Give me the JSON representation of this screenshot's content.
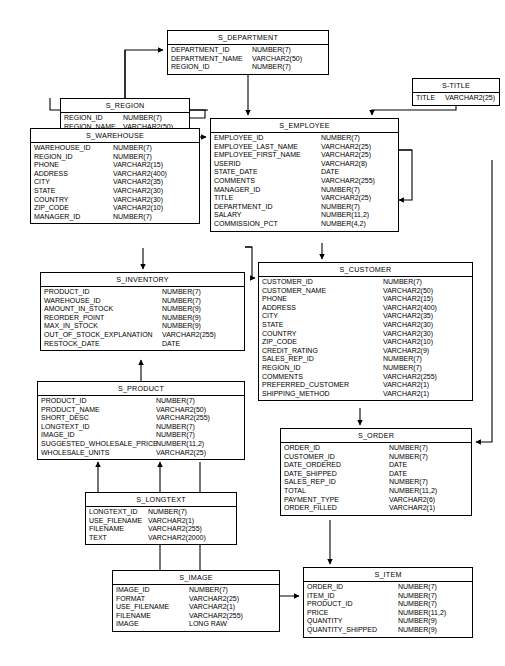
{
  "diagram": {
    "type": "entity-relationship",
    "background": "#ffffff",
    "line_color": "#000000"
  },
  "tables": [
    {
      "id": "s_department",
      "name": "S_DEPARTMENT",
      "x": 167,
      "y": 30,
      "w": 162,
      "type_x": 84,
      "columns": [
        {
          "name": "DEPARTMENT_ID",
          "type": "NUMBER(7)"
        },
        {
          "name": "DEPARTMENT_NAME",
          "type": "VARCHAR2(50)"
        },
        {
          "name": "REGION_ID",
          "type": "NUMBER(7)"
        }
      ]
    },
    {
      "id": "s_title",
      "name": "S-TITLE",
      "x": 412,
      "y": 78,
      "w": 88,
      "type_x": 32,
      "columns": [
        {
          "name": "TITLE",
          "type": "VARCHAR2(25)"
        }
      ]
    },
    {
      "id": "s_region",
      "name": "S_REGION",
      "x": 60,
      "y": 98,
      "w": 130,
      "type_x": 62,
      "columns": [
        {
          "name": "REGION_ID",
          "type": "NUMBER(7)"
        },
        {
          "name": "REGION_NAME",
          "type": "VARCHAR2(50)"
        }
      ]
    },
    {
      "id": "s_employee",
      "name": "S_EMPLOYEE",
      "x": 210,
      "y": 118,
      "w": 189,
      "type_x": 110,
      "columns": [
        {
          "name": "EMPLOYEE_ID",
          "type": "NUMBER(7)"
        },
        {
          "name": "EMPLOYEE_LAST_NAME",
          "type": "VARCHAR2(25)"
        },
        {
          "name": "EMPLOYEE_FIRST_NAME",
          "type": "VARCHAR2(25)"
        },
        {
          "name": "USERID",
          "type": "VARCHAR2(8)"
        },
        {
          "name": "STATE_DATE",
          "type": "DATE"
        },
        {
          "name": "COMMENTS",
          "type": "VARCHAR2(255)"
        },
        {
          "name": "MANAGER_ID",
          "type": "NUMBER(7)"
        },
        {
          "name": "TITLE",
          "type": "VARCHAR2(25)"
        },
        {
          "name": "DEPARTMENT_ID",
          "type": "NUMBER(7)"
        },
        {
          "name": "SALARY",
          "type": "NUMBER(11,2)"
        },
        {
          "name": "COMMISSION_PCT",
          "type": "NUMBER(4,2)"
        }
      ]
    },
    {
      "id": "s_warehouse",
      "name": "S_WAREHOUSE",
      "x": 30,
      "y": 128,
      "w": 170,
      "type_x": 82,
      "columns": [
        {
          "name": "WAREHOUSE_ID",
          "type": "NUMBER(7)"
        },
        {
          "name": "REGION_ID",
          "type": "NUMBER(7)"
        },
        {
          "name": "PHONE",
          "type": "VARCHAR2(15)"
        },
        {
          "name": "ADDRESS",
          "type": "VARCHAR2(400)"
        },
        {
          "name": "CITY",
          "type": "VARCHAR2(35)"
        },
        {
          "name": "STATE",
          "type": "VARCHAR2(30)"
        },
        {
          "name": "COUNTRY",
          "type": "VARCHAR2(30)"
        },
        {
          "name": "ZIP_CODE",
          "type": "VARCHAR2(10)"
        },
        {
          "name": "MANAGER_ID",
          "type": "NUMBER(7)"
        }
      ]
    },
    {
      "id": "s_inventory",
      "name": "S_INVENTORY",
      "x": 40,
      "y": 272,
      "w": 205,
      "type_x": 121,
      "columns": [
        {
          "name": "PRODUCT_ID",
          "type": "NUMBER(7)"
        },
        {
          "name": "WAREHOUSE_ID",
          "type": "NUMBER(7)"
        },
        {
          "name": "AMOUNT_IN_STOCK",
          "type": "NUMBER(9)"
        },
        {
          "name": "REORDER_POINT",
          "type": "NUMBER(9)"
        },
        {
          "name": "MAX_IN_STOCK",
          "type": "NUMBER(9)"
        },
        {
          "name": "OUT_OF_STOCK_EXPLANATION",
          "type": "VARCHAR2(255)"
        },
        {
          "name": "RESTOCK_DATE",
          "type": "DATE"
        }
      ]
    },
    {
      "id": "s_customer",
      "name": "S_CUSTOMER",
      "x": 258,
      "y": 262,
      "w": 215,
      "type_x": 124,
      "columns": [
        {
          "name": "CUSTOMER_ID",
          "type": "NUMBER(7)"
        },
        {
          "name": "CUSTOMER_NAME",
          "type": "VARCHAR2(50)"
        },
        {
          "name": "PHONE",
          "type": "VARCHAR2(15)"
        },
        {
          "name": "ADDRESS",
          "type": "VARCHAR2(400)"
        },
        {
          "name": "CITY",
          "type": "VARCHAR2(35)"
        },
        {
          "name": "STATE",
          "type": "VARCHAR2(30)"
        },
        {
          "name": "COUNTRY",
          "type": "VARCHAR2(30)"
        },
        {
          "name": "ZIP_CODE",
          "type": "VARCHAR2(10)"
        },
        {
          "name": "CREDIT_RATING",
          "type": "VARCHAR2(9)"
        },
        {
          "name": "SALES_REP_ID",
          "type": "NUMBER(7)"
        },
        {
          "name": "REGION_ID",
          "type": "NUMBER(7)"
        },
        {
          "name": "COMMENTS",
          "type": "VARCHAR2(255)"
        },
        {
          "name": "PREFERRED_CUSTOMER",
          "type": "VARCHAR2(1)"
        },
        {
          "name": "SHIPPING_METHOD",
          "type": "VARCHAR2(1)"
        }
      ]
    },
    {
      "id": "s_product",
      "name": "S_PRODUCT",
      "x": 37,
      "y": 381,
      "w": 208,
      "type_x": 118,
      "columns": [
        {
          "name": "PRODUCT_ID",
          "type": "NUMBER(7)"
        },
        {
          "name": "PRODUCT_NAME",
          "type": "VARCHAR2(50)"
        },
        {
          "name": "SHORT_DESC",
          "type": "VARCHAR2(255)"
        },
        {
          "name": "LONGTEXT_ID",
          "type": "NUMBER(7)"
        },
        {
          "name": "IMAGE_ID",
          "type": "NUMBER(7)"
        },
        {
          "name": "SUGGESTED_WHOLESALE_PRICE",
          "type": "NUMBER(11,2)"
        },
        {
          "name": "WHOLESALE_UNITS",
          "type": "VARCHAR2(25)"
        }
      ]
    },
    {
      "id": "s_order",
      "name": "S_ORDER",
      "x": 280,
      "y": 428,
      "w": 192,
      "type_x": 108,
      "columns": [
        {
          "name": "ORDER_ID",
          "type": "NUMBER(7)"
        },
        {
          "name": "CUSTOMER_ID",
          "type": "NUMBER(7)"
        },
        {
          "name": "DATE_ORDERED",
          "type": "DATE"
        },
        {
          "name": "DATE_SHIPPED",
          "type": "DATE"
        },
        {
          "name": "SALES_REP_ID",
          "type": "NUMBER(7)"
        },
        {
          "name": "TOTAL",
          "type": "NUMBER(11,2)"
        },
        {
          "name": "PAYMENT_TYPE",
          "type": "VARCHAR2(6)"
        },
        {
          "name": "ORDER_FILLED",
          "type": "VARCHAR2(1)"
        }
      ]
    },
    {
      "id": "s_longtext",
      "name": "S_LONGTEXT",
      "x": 85,
      "y": 492,
      "w": 152,
      "type_x": 62,
      "columns": [
        {
          "name": "LONGTEXT_ID",
          "type": "NUMBER(7)"
        },
        {
          "name": "USE_FILENAME",
          "type": "VARCHAR2(1)"
        },
        {
          "name": "FILENAME",
          "type": "VARCHAR2(255)"
        },
        {
          "name": "TEXT",
          "type": "VARCHAR2(2000)"
        }
      ]
    },
    {
      "id": "s_image",
      "name": "S_IMAGE",
      "x": 112,
      "y": 570,
      "w": 168,
      "type_x": 76,
      "columns": [
        {
          "name": "IMAGE_ID",
          "type": "NUMBER(7)"
        },
        {
          "name": "FORMAT",
          "type": "VARCHAR2(25)"
        },
        {
          "name": "USE_FILENAME",
          "type": "VARCHAR2(1)"
        },
        {
          "name": "FILENAME",
          "type": "VARCHAR2(255)"
        },
        {
          "name": "IMAGE",
          "type": "LONG RAW"
        }
      ]
    },
    {
      "id": "s_item",
      "name": "S_ITEM",
      "x": 303,
      "y": 567,
      "w": 170,
      "type_x": 94,
      "columns": [
        {
          "name": "ORDER_ID",
          "type": "NUMBER(7)"
        },
        {
          "name": "ITEM_ID",
          "type": "NUMBER(7)"
        },
        {
          "name": "PRODUCT_ID",
          "type": "NUMBER(7)"
        },
        {
          "name": "PRICE",
          "type": "NUMBER(11,2)"
        },
        {
          "name": "QUANTITY",
          "type": "NUMBER(9)"
        },
        {
          "name": "QUANTITY_SHIPPED",
          "type": "NUMBER(9)"
        }
      ]
    }
  ],
  "relationships": [
    {
      "from": "s_region",
      "to": "s_department",
      "label": ""
    },
    {
      "from": "s_region",
      "to": "s_warehouse",
      "label": ""
    },
    {
      "from": "s_region",
      "to": "s_employee",
      "label": ""
    },
    {
      "from": "s_department",
      "to": "s_employee",
      "label": ""
    },
    {
      "from": "s_title",
      "to": "s_employee",
      "label": ""
    },
    {
      "from": "s_employee",
      "to": "s_employee",
      "label": ""
    },
    {
      "from": "s_employee",
      "to": "s_customer",
      "label": ""
    },
    {
      "from": "s_warehouse",
      "to": "s_inventory",
      "label": ""
    },
    {
      "from": "s_product",
      "to": "s_inventory",
      "label": ""
    },
    {
      "from": "s_customer",
      "to": "s_order",
      "label": ""
    },
    {
      "from": "s_employee",
      "to": "s_order",
      "label": ""
    },
    {
      "from": "s_longtext",
      "to": "s_product",
      "label": ""
    },
    {
      "from": "s_image",
      "to": "s_product",
      "label": ""
    },
    {
      "from": "s_order",
      "to": "s_item",
      "label": ""
    },
    {
      "from": "s_product",
      "to": "s_item",
      "label": ""
    }
  ]
}
